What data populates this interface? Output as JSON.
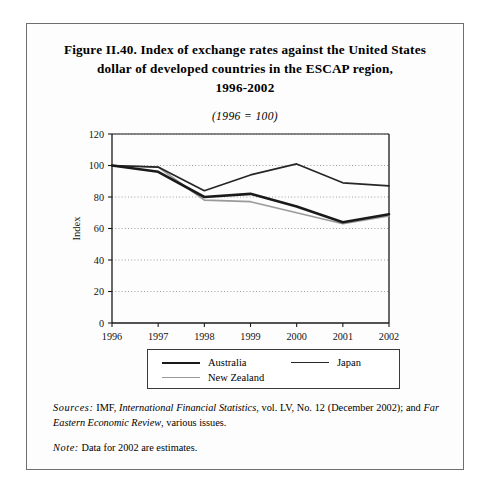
{
  "figure": {
    "title_lines": [
      "Figure II.40.  Index of exchange rates against the United States",
      "dollar of developed countries in the ESCAP region,",
      "1996-2002"
    ],
    "subtitle": "(1996 = 100)"
  },
  "notes": {
    "sources_label": "Sources:",
    "sources_text_1": "IMF,",
    "sources_italic_1": "International Financial Statistics",
    "sources_text_2": ", vol. LV, No. 12 (December  2002); and",
    "sources_italic_2": "Far Eastern Economic Review",
    "sources_text_3": ", various issues.",
    "note_label": "Note:",
    "note_text": "Data for 2002 are estimates."
  },
  "legend": {
    "items": [
      {
        "label": "Australia",
        "color": "#1a1a1a",
        "width": 2.6
      },
      {
        "label": "Japan",
        "color": "#262626",
        "width": 1.7
      },
      {
        "label": "New Zealand",
        "color": "#9a9a9a",
        "width": 1.7
      }
    ]
  },
  "chart_data": {
    "type": "line",
    "title": "Index of exchange rates against the United States dollar of developed countries in the ESCAP region, 1996-2002",
    "subtitle": "(1996 = 100)",
    "xlabel": "",
    "ylabel": "Index",
    "categories": [
      "1996",
      "1997",
      "1998",
      "1999",
      "2000",
      "2001",
      "2002"
    ],
    "x": [
      1996,
      1997,
      1998,
      1999,
      2000,
      2001,
      2002
    ],
    "ylim": [
      0,
      120
    ],
    "yticks": [
      0,
      20,
      40,
      60,
      80,
      100,
      120
    ],
    "ytick_labels": [
      "0",
      "20",
      "40",
      "60",
      "80",
      "100",
      "120"
    ],
    "xtick_labels": [
      "1996",
      "1997",
      "1998",
      "1999",
      "2000",
      "2001",
      "2002"
    ],
    "grid": "horizontal-dotted",
    "legend_position": "below-plot",
    "series": [
      {
        "name": "Australia",
        "color": "#1a1a1a",
        "width": 2.6,
        "values": [
          100,
          96,
          80,
          82,
          74,
          64,
          69
        ]
      },
      {
        "name": "Japan",
        "color": "#262626",
        "width": 1.7,
        "values": [
          100,
          99,
          84,
          94,
          101,
          89,
          87
        ]
      },
      {
        "name": "New Zealand",
        "color": "#9a9a9a",
        "width": 1.7,
        "values": [
          100,
          99,
          78,
          77,
          70,
          63,
          68
        ]
      }
    ]
  },
  "plot_geometry": {
    "svg_width": 438,
    "svg_height": 232,
    "left": 85,
    "right": 362,
    "top": 12,
    "bottom": 201
  }
}
